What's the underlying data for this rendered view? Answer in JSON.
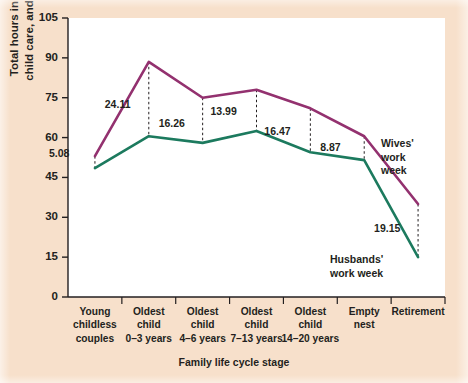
{
  "figure": {
    "background_color": "#f7e0cb",
    "plot_background_color": "#ffffff",
    "wives_color": "#93316f",
    "husbands_color": "#1c7a5e"
  },
  "chart_data": {
    "type": "line",
    "title": "",
    "xlabel": "Family life cycle stage",
    "ylabel": "Total hours in housework,\nchild care, and employment",
    "ylim": [
      0,
      105
    ],
    "yticks": [
      0,
      15,
      30,
      45,
      60,
      75,
      90,
      105
    ],
    "grid": false,
    "legend": "inline-annotations",
    "categories": [
      "Young\nchildless\ncouples",
      "Oldest\nchild\n0–3 years",
      "Oldest\nchild\n4–6 years",
      "Oldest\nchild\n7–13 years",
      "Oldest\nchild\n14–20 years",
      "Empty\nnest",
      "Retirement"
    ],
    "series": [
      {
        "name": "Wives' work week",
        "color": "#93316f",
        "values": [
          53.0,
          88.5,
          75.0,
          78.0,
          71.0,
          60.5,
          35.0
        ]
      },
      {
        "name": "Husbands' work week",
        "color": "#1c7a5e",
        "values": [
          48.5,
          60.5,
          58.0,
          62.5,
          54.5,
          51.5,
          15.0
        ]
      }
    ],
    "gap_annotations": [
      {
        "category_index": 0,
        "label": "5.08"
      },
      {
        "category_index": 1,
        "label": "24.11"
      },
      {
        "category_index": 2,
        "label": "16.26"
      },
      {
        "category_index": 3,
        "label": "13.99"
      },
      {
        "category_index": 4,
        "label": "16.47"
      },
      {
        "category_index": 5,
        "label": "8.87"
      },
      {
        "category_index": 6,
        "label": "19.15"
      }
    ],
    "series_callouts": [
      {
        "text": "Wives'\nwork\nweek",
        "series": "Wives' work week"
      },
      {
        "text": "Husbands'\nwork week",
        "series": "Husbands' work week"
      }
    ]
  }
}
